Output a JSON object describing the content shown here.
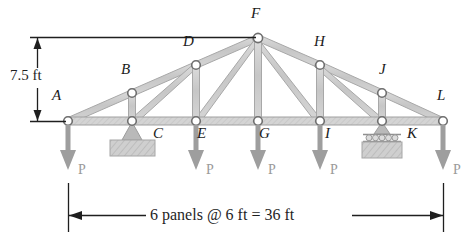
{
  "figure": {
    "type": "truss-diagram",
    "colors": {
      "member_fill": "#c9c9c9",
      "member_stroke": "#a0a0a0",
      "node_stroke": "#6e6e6e",
      "node_fill": "#ffffff",
      "load_arrow": "#9a9a9a",
      "support": "#b4b4b4",
      "dimension_line": "#1f1f1f",
      "label_text": "#1a1a1a",
      "load_label_text": "#9a9a9a"
    },
    "nodes": [
      {
        "id": "A",
        "label": "A",
        "x": 68,
        "y": 121,
        "label_x": 52,
        "label_y": 96,
        "chord": "both"
      },
      {
        "id": "B",
        "label": "B",
        "x": 132,
        "y": 93,
        "label_x": 121,
        "label_y": 69,
        "chord": "top"
      },
      {
        "id": "C",
        "label": "C",
        "x": 132,
        "y": 121,
        "label_x": 155,
        "label_y": 129,
        "chord": "bottom"
      },
      {
        "id": "D",
        "label": "D",
        "x": 196,
        "y": 65,
        "label_x": 183,
        "label_y": 41,
        "chord": "top"
      },
      {
        "id": "E",
        "label": "E",
        "x": 196,
        "y": 121,
        "label_x": 198,
        "label_y": 129,
        "chord": "bottom"
      },
      {
        "id": "F",
        "label": "F",
        "x": 258,
        "y": 38,
        "label_x": 250,
        "label_y": 13,
        "chord": "apex"
      },
      {
        "id": "G",
        "label": "G",
        "x": 258,
        "y": 121,
        "label_x": 259,
        "label_y": 129,
        "chord": "bottom"
      },
      {
        "id": "H",
        "label": "H",
        "x": 320,
        "y": 65,
        "label_x": 314,
        "label_y": 41,
        "chord": "top"
      },
      {
        "id": "I",
        "label": "I",
        "x": 320,
        "y": 121,
        "label_x": 324,
        "label_y": 129,
        "chord": "bottom"
      },
      {
        "id": "J",
        "label": "J",
        "x": 382,
        "y": 93,
        "label_x": 379,
        "label_y": 67,
        "chord": "top"
      },
      {
        "id": "K",
        "label": "K",
        "x": 382,
        "y": 121,
        "label_x": 408,
        "label_y": 129,
        "chord": "bottom"
      },
      {
        "id": "L",
        "label": "L",
        "x": 443,
        "y": 121,
        "label_x": 437,
        "label_y": 96,
        "chord": "both"
      }
    ],
    "members": {
      "top_chord": [
        "A-B",
        "B-D",
        "D-F",
        "F-H",
        "H-J",
        "J-L"
      ],
      "bottom_chord": [
        "A-C",
        "C-E",
        "E-G",
        "G-I",
        "I-K",
        "K-L"
      ],
      "verticals": [
        "B-C",
        "D-E",
        "F-G",
        "H-I",
        "J-K"
      ],
      "diagonals": [
        "C-D",
        "E-F",
        "F-I",
        "H-K"
      ]
    },
    "supports": [
      {
        "node": "K",
        "type": "roller",
        "label": "K",
        "x": 382,
        "y": 121
      },
      {
        "node": "C",
        "type": "pin",
        "label": "C",
        "x": 132,
        "y": 121
      }
    ],
    "loads": [
      {
        "node": "A",
        "label": "P",
        "x": 68,
        "label_x": 78,
        "label_y": 170
      },
      {
        "node": "E",
        "label": "P",
        "x": 196,
        "label_x": 206,
        "label_y": 170
      },
      {
        "node": "G",
        "label": "P",
        "x": 258,
        "label_x": 268,
        "label_y": 170
      },
      {
        "node": "I",
        "label": "P",
        "x": 320,
        "label_x": 330,
        "label_y": 170
      },
      {
        "node": "L",
        "label": "P",
        "x": 443,
        "label_x": 453,
        "label_y": 170
      }
    ],
    "dimensions": {
      "height": {
        "text": "7.5 ft",
        "value": 7.5,
        "unit": "ft",
        "orientation": "vertical",
        "label_x": 12,
        "label_y": 68,
        "line_x": 37,
        "top_y": 38,
        "bottom_y": 121
      },
      "span": {
        "text": "6 panels @ 6 ft = 36 ft",
        "panels": 6,
        "panel_length": 6,
        "total": 36,
        "unit": "ft",
        "orientation": "horizontal",
        "label_x": 148,
        "label_y": 208,
        "line_y": 216,
        "left_x": 68,
        "right_x": 443
      }
    }
  }
}
